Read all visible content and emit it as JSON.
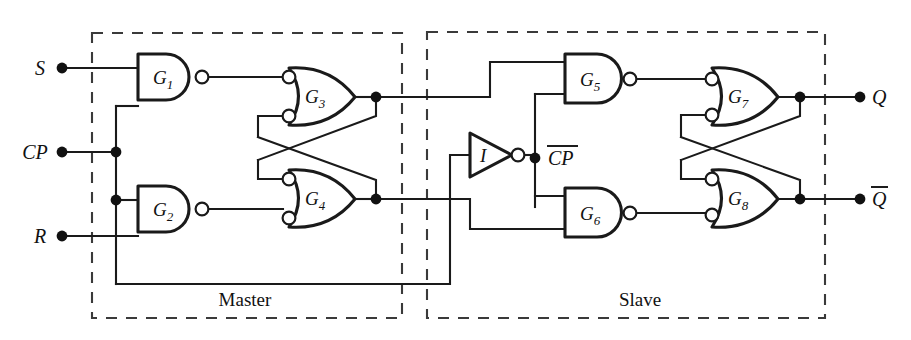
{
  "diagram": {
    "type": "logic-circuit-schematic",
    "width": 911,
    "height": 340,
    "line_color": "#1a1a1a",
    "dash_color": "#3a3a3a",
    "background": "#ffffff"
  },
  "inputs": [
    {
      "id": "S",
      "label": "S",
      "terminal_x": 62,
      "terminal_y": 68
    },
    {
      "id": "CP",
      "label": "CP",
      "terminal_x": 62,
      "terminal_y": 152
    },
    {
      "id": "R",
      "label": "R",
      "terminal_x": 62,
      "terminal_y": 236
    }
  ],
  "outputs": [
    {
      "id": "Q",
      "label": "Q",
      "overbar": false,
      "terminal_x": 860,
      "terminal_y": 97
    },
    {
      "id": "Qbar",
      "label": "Q",
      "overbar": true,
      "terminal_x": 860,
      "terminal_y": 199
    }
  ],
  "internal_labels": [
    {
      "id": "CPbar",
      "label": "CP",
      "overbar": true,
      "x": 548,
      "y": 158
    }
  ],
  "gates": [
    {
      "id": "G1",
      "label": "G",
      "sub": "1",
      "type": "nand",
      "x": 138,
      "y": 54,
      "w": 57,
      "h": 46
    },
    {
      "id": "G2",
      "label": "G",
      "sub": "2",
      "type": "nand",
      "x": 138,
      "y": 186,
      "w": 57,
      "h": 46
    },
    {
      "id": "G3",
      "label": "G",
      "sub": "3",
      "type": "nor",
      "x": 289,
      "y": 68,
      "w": 66,
      "h": 57
    },
    {
      "id": "G4",
      "label": "G",
      "sub": "4",
      "type": "nor",
      "x": 289,
      "y": 170,
      "w": 66,
      "h": 57
    },
    {
      "id": "G5",
      "label": "G",
      "sub": "5",
      "type": "nand",
      "x": 565,
      "y": 54,
      "w": 57,
      "h": 49
    },
    {
      "id": "G6",
      "label": "G",
      "sub": "6",
      "type": "nand",
      "x": 565,
      "y": 188,
      "w": 57,
      "h": 49
    },
    {
      "id": "G7",
      "label": "G",
      "sub": "7",
      "type": "nor",
      "x": 712,
      "y": 68,
      "w": 66,
      "h": 57
    },
    {
      "id": "G8",
      "label": "G",
      "sub": "8",
      "type": "nor",
      "x": 712,
      "y": 170,
      "w": 66,
      "h": 57
    },
    {
      "id": "I",
      "label": "I",
      "sub": "",
      "type": "inverter",
      "x": 470,
      "y": 133,
      "w": 42,
      "h": 44
    }
  ],
  "sections": [
    {
      "id": "master",
      "label": "Master",
      "x": 92,
      "y": 33,
      "w": 310,
      "h": 285,
      "label_x": 245,
      "label_y": 306
    },
    {
      "id": "slave",
      "label": "Slave",
      "x": 427,
      "y": 32,
      "w": 398,
      "h": 286,
      "label_x": 640,
      "label_y": 306
    }
  ],
  "junction_dots": [
    {
      "x": 116,
      "y": 152
    },
    {
      "x": 116,
      "y": 200
    },
    {
      "x": 376,
      "y": 97
    },
    {
      "x": 376,
      "y": 199
    },
    {
      "x": 535,
      "y": 158
    },
    {
      "x": 800,
      "y": 97
    },
    {
      "x": 800,
      "y": 199
    }
  ]
}
